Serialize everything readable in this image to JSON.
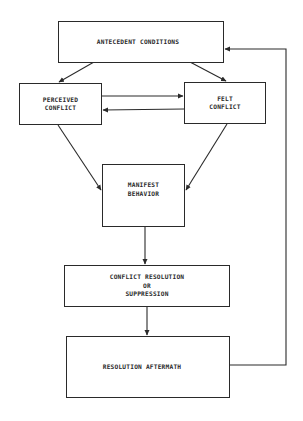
{
  "diagram": {
    "title": "",
    "nodes": [
      {
        "id": "antecedent",
        "label": "ANTECEDENT CONDITIONS"
      },
      {
        "id": "perceived",
        "label": "PERCEIVED\nCONFLICT"
      },
      {
        "id": "felt",
        "label": "FELT\nCONFLICT"
      },
      {
        "id": "manifest",
        "label": "MANIFEST\nBEHAVIOR"
      },
      {
        "id": "resolution",
        "label": "CONFLICT  RESOLUTION\nOR\nSUPPRESSION"
      },
      {
        "id": "aftermath",
        "label": "RESOLUTION  AFTERMATH"
      }
    ],
    "edges": [
      {
        "from": "antecedent",
        "to": "perceived"
      },
      {
        "from": "antecedent",
        "to": "felt"
      },
      {
        "from": "perceived",
        "to": "felt"
      },
      {
        "from": "felt",
        "to": "perceived"
      },
      {
        "from": "perceived",
        "to": "manifest"
      },
      {
        "from": "felt",
        "to": "manifest"
      },
      {
        "from": "manifest",
        "to": "resolution"
      },
      {
        "from": "resolution",
        "to": "aftermath"
      },
      {
        "from": "aftermath",
        "to": "antecedent",
        "type": "feedback"
      }
    ],
    "colors": {
      "line": "#2a2a2a",
      "background": "#ffffff"
    }
  }
}
